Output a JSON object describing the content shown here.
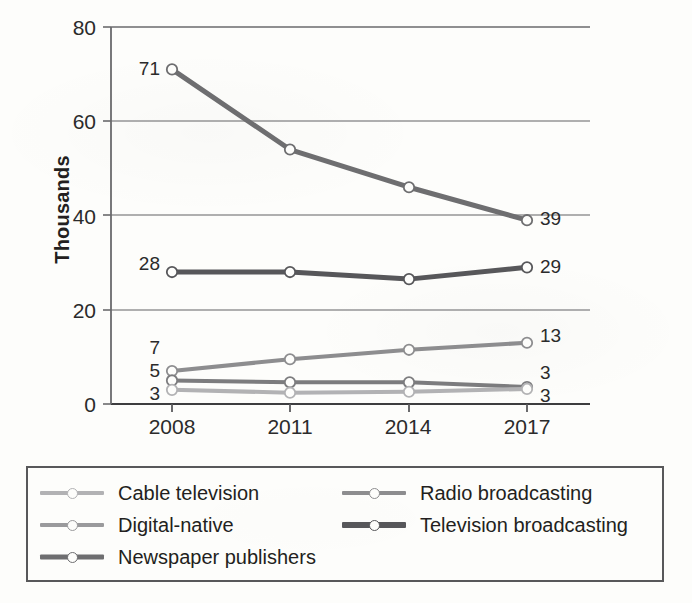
{
  "chart_data": {
    "type": "line",
    "title": "",
    "xlabel": "",
    "ylabel": "Thousands",
    "categories": [
      "2008",
      "2011",
      "2014",
      "2017"
    ],
    "x_ticks": [
      "2008",
      "2011",
      "2014",
      "2017"
    ],
    "y_ticks": [
      "0",
      "20",
      "40",
      "60",
      "80"
    ],
    "ylim": [
      0,
      80
    ],
    "grid": "horizontal",
    "legend_position": "bottom",
    "series": [
      {
        "name": "Newspaper publishers",
        "color": "#6e6e70",
        "width": 5,
        "values": [
          71,
          54,
          46,
          39
        ],
        "start_label": "71",
        "end_label": "39"
      },
      {
        "name": "Television broadcasting",
        "color": "#57575a",
        "width": 5,
        "values": [
          28,
          28,
          26.5,
          29
        ],
        "start_label": "28",
        "end_label": "29"
      },
      {
        "name": "Radio broadcasting",
        "color": "#8d8d8f",
        "width": 4,
        "values": [
          7,
          9.5,
          11.5,
          13
        ],
        "start_label": "7",
        "end_label": "13"
      },
      {
        "name": "Digital-native",
        "color": "#7c7c7e",
        "width": 4,
        "values": [
          5,
          4.6,
          4.6,
          3.6
        ],
        "start_label": "5",
        "end_label": "3"
      },
      {
        "name": "Cable television",
        "color": "#b2b2b4",
        "width": 4,
        "values": [
          3,
          2.4,
          2.6,
          3.2
        ],
        "start_label": "3",
        "end_label": "3"
      }
    ],
    "point_labels_left": [
      "71",
      "28",
      "7",
      "5",
      "3"
    ],
    "point_labels_right": [
      "39",
      "29",
      "13",
      "3",
      "3"
    ]
  },
  "legend": {
    "items": [
      {
        "label": "Cable television",
        "color": "#b2b2b4",
        "width": 4
      },
      {
        "label": "Radio broadcasting",
        "color": "#8d8d8f",
        "width": 4
      },
      {
        "label": "Digital-native",
        "color": "#9a9a9c",
        "width": 4
      },
      {
        "label": "Television broadcasting",
        "color": "#57575a",
        "width": 6
      },
      {
        "label": "Newspaper publishers",
        "color": "#6e6e70",
        "width": 5
      }
    ]
  }
}
